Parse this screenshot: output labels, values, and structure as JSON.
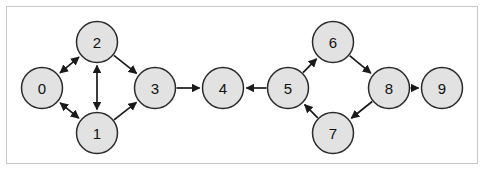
{
  "figure": {
    "border_color": "#c8c8c8",
    "background_color": "#ffffff",
    "width": 485,
    "height": 172
  },
  "graph": {
    "type": "directed-graph",
    "node_fill": "#e2e2e2",
    "node_stroke": "#2b2b2b",
    "edge_color": "#1a1a1a",
    "node_radius": 20.5,
    "nodes": [
      {
        "id": "0",
        "label": "0",
        "x": 42,
        "y": 88
      },
      {
        "id": "1",
        "label": "1",
        "x": 97,
        "y": 133
      },
      {
        "id": "2",
        "label": "2",
        "x": 97,
        "y": 42
      },
      {
        "id": "3",
        "label": "3",
        "x": 155,
        "y": 88
      },
      {
        "id": "4",
        "label": "4",
        "x": 223,
        "y": 88
      },
      {
        "id": "5",
        "label": "5",
        "x": 288,
        "y": 88
      },
      {
        "id": "6",
        "label": "6",
        "x": 333,
        "y": 42
      },
      {
        "id": "7",
        "label": "7",
        "x": 333,
        "y": 133
      },
      {
        "id": "8",
        "label": "8",
        "x": 389,
        "y": 88
      },
      {
        "id": "9",
        "label": "9",
        "x": 442,
        "y": 88
      }
    ],
    "edges": [
      {
        "from": "0",
        "to": "2",
        "direction": "both"
      },
      {
        "from": "0",
        "to": "1",
        "direction": "both"
      },
      {
        "from": "1",
        "to": "2",
        "direction": "both"
      },
      {
        "from": "2",
        "to": "3",
        "direction": "forward"
      },
      {
        "from": "1",
        "to": "3",
        "direction": "forward"
      },
      {
        "from": "3",
        "to": "4",
        "direction": "forward"
      },
      {
        "from": "5",
        "to": "4",
        "direction": "forward"
      },
      {
        "from": "5",
        "to": "6",
        "direction": "forward"
      },
      {
        "from": "6",
        "to": "8",
        "direction": "forward"
      },
      {
        "from": "8",
        "to": "7",
        "direction": "forward"
      },
      {
        "from": "7",
        "to": "5",
        "direction": "forward"
      },
      {
        "from": "8",
        "to": "9",
        "direction": "forward"
      }
    ]
  }
}
